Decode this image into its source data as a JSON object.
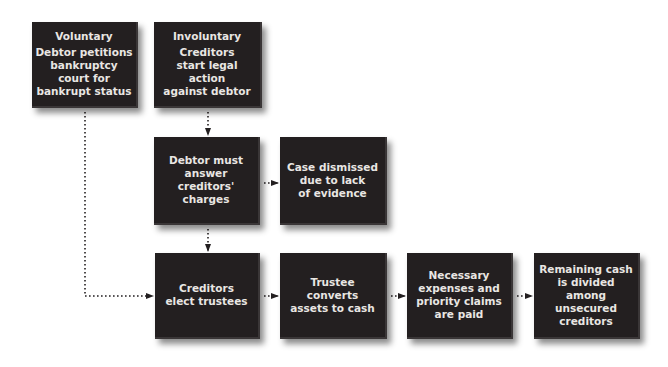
{
  "diagram": {
    "colors": {
      "box_fill": "#231f20",
      "box_text": "#e9e6e3",
      "connector": "#231f20",
      "background": "#ffffff"
    },
    "nodes": [
      {
        "id": "voluntary",
        "title": "Voluntary",
        "lines": [
          "Debtor petitions",
          "bankruptcy",
          "court for",
          "bankrupt status"
        ]
      },
      {
        "id": "involuntary",
        "title": "Involuntary",
        "lines": [
          "Creditors",
          "start legal action",
          "against debtor"
        ]
      },
      {
        "id": "debtor-answer",
        "lines": [
          "Debtor must",
          "answer",
          "creditors'",
          "charges"
        ]
      },
      {
        "id": "case-dismissed",
        "lines": [
          "Case dismissed",
          "due to lack",
          "of evidence"
        ]
      },
      {
        "id": "elect-trustees",
        "lines": [
          "Creditors",
          "elect trustees"
        ]
      },
      {
        "id": "trustee-converts",
        "lines": [
          "Trustee converts",
          "assets to cash"
        ]
      },
      {
        "id": "expenses-paid",
        "lines": [
          "Necessary",
          "expenses and",
          "priority claims",
          "are paid"
        ]
      },
      {
        "id": "cash-divided",
        "lines": [
          "Remaining cash",
          "is divided",
          "among",
          "unsecured",
          "creditors"
        ]
      }
    ],
    "edges": [
      {
        "from": "involuntary",
        "to": "debtor-answer",
        "style": "dotted-arrow"
      },
      {
        "from": "debtor-answer",
        "to": "case-dismissed",
        "style": "dotted-arrow"
      },
      {
        "from": "debtor-answer",
        "to": "elect-trustees",
        "style": "dotted-arrow"
      },
      {
        "from": "voluntary",
        "to": "elect-trustees",
        "style": "dotted-arrow"
      },
      {
        "from": "elect-trustees",
        "to": "trustee-converts",
        "style": "dotted-arrow"
      },
      {
        "from": "trustee-converts",
        "to": "expenses-paid",
        "style": "dotted-arrow"
      },
      {
        "from": "expenses-paid",
        "to": "cash-divided",
        "style": "dotted-arrow"
      }
    ]
  }
}
